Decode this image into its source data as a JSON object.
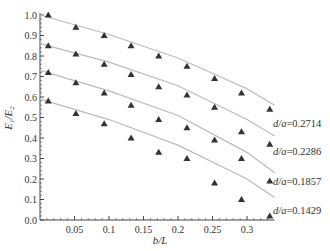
{
  "chart_data": {
    "type": "scatter",
    "title": "",
    "xlabel": "b/L",
    "ylabel": "E1/E2",
    "xlim": [
      0,
      0.34
    ],
    "ylim": [
      0.0,
      1.0
    ],
    "x_ticks": [
      "0.05",
      "0.1",
      "0.15",
      "0.2",
      "0.25",
      "0.3"
    ],
    "y_ticks": [
      "0.0",
      "0.1",
      "0.2",
      "0.3",
      "0.4",
      "0.5",
      "0.6",
      "0.7",
      "0.8",
      "0.9",
      "1.0"
    ],
    "grid": false,
    "legend_position": "inline-right",
    "marker": "triangle",
    "fit_line_color": "#bbbbbb",
    "marker_color": "#333333",
    "x": [
      0.012,
      0.052,
      0.093,
      0.132,
      0.172,
      0.213,
      0.253,
      0.292,
      0.333
    ],
    "series": [
      {
        "name": "d/a=0.2714",
        "label": "d/a=0.2714",
        "values": [
          1.0,
          0.94,
          0.9,
          0.85,
          0.8,
          0.75,
          0.69,
          0.62,
          0.54
        ],
        "fit": [
          [
            0.0,
            1.0
          ],
          [
            0.1,
            0.905
          ],
          [
            0.2,
            0.79
          ],
          [
            0.3,
            0.64
          ],
          [
            0.34,
            0.56
          ]
        ]
      },
      {
        "name": "d/a=0.2286",
        "label": "d/a=0.2286",
        "values": [
          0.85,
          0.81,
          0.76,
          0.71,
          0.65,
          0.61,
          0.55,
          0.43,
          0.37
        ],
        "fit": [
          [
            0.0,
            0.86
          ],
          [
            0.1,
            0.77
          ],
          [
            0.2,
            0.655
          ],
          [
            0.3,
            0.49
          ],
          [
            0.34,
            0.41
          ]
        ]
      },
      {
        "name": "d/a=0.1857",
        "label": "d/a=0.1857",
        "values": [
          0.72,
          0.67,
          0.62,
          0.56,
          0.49,
          0.45,
          0.39,
          0.3,
          0.19
        ],
        "fit": [
          [
            0.0,
            0.73
          ],
          [
            0.1,
            0.63
          ],
          [
            0.2,
            0.51
          ],
          [
            0.3,
            0.33
          ],
          [
            0.34,
            0.23
          ]
        ]
      },
      {
        "name": "d/a=0.1429",
        "label": "d/a=0.1429",
        "values": [
          0.58,
          0.52,
          0.47,
          0.4,
          0.33,
          0.3,
          0.18,
          0.1,
          0.02
        ],
        "fit": [
          [
            0.0,
            0.59
          ],
          [
            0.1,
            0.49
          ],
          [
            0.2,
            0.365
          ],
          [
            0.3,
            0.2
          ],
          [
            0.34,
            0.11
          ]
        ]
      }
    ]
  }
}
